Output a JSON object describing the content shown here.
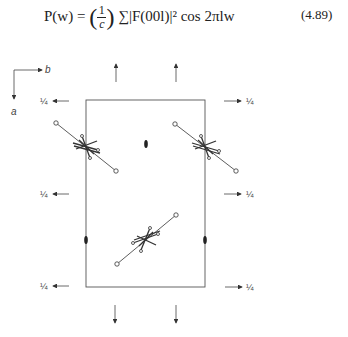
{
  "equation": {
    "lhs": "P(w) =",
    "frac_num": "1",
    "frac_den": "c",
    "sum_term": "∑|F(00l)|² cos 2πlw",
    "number": "(4.89)"
  },
  "axes": {
    "horizontal": "b",
    "vertical": "a"
  },
  "quarter_labels": {
    "left": [
      "¼",
      "¼",
      "¼"
    ],
    "right": [
      "¼",
      "¼",
      "¼"
    ]
  },
  "diagram": {
    "unit_cell": {
      "x": 86,
      "y": 100,
      "width": 119,
      "height": 187
    },
    "stroke_color": "#444444"
  }
}
